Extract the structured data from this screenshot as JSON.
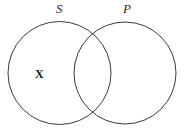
{
  "figure": {
    "name": "venn-diagram",
    "type": "two-set-venn",
    "background_color": "#ffffff",
    "stroke_color": "#3a3a3a",
    "stroke_width": 1,
    "width": 185,
    "height": 138
  },
  "sets": [
    {
      "id": "s",
      "label": "S",
      "label_style": "italic-serif",
      "cx": 59.5,
      "cy": 73,
      "r": 51.5
    },
    {
      "id": "p",
      "label": "P",
      "label_style": "italic-serif",
      "cx": 125,
      "cy": 73,
      "r": 51
    }
  ],
  "marks": [
    {
      "id": "x",
      "text": "X",
      "region": "s-only",
      "style": "bold-serif",
      "x": 40,
      "y": 74
    }
  ]
}
